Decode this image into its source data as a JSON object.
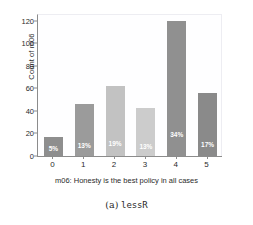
{
  "figure": {
    "caption_tag": "(a)",
    "caption_name": "lessR"
  },
  "chart_data": {
    "type": "bar",
    "title": "",
    "categories": [
      "0",
      "1",
      "2",
      "3",
      "4",
      "5"
    ],
    "values": [
      17,
      46,
      62,
      43,
      120,
      56
    ],
    "data_labels": [
      "5%",
      "13%",
      "19%",
      "13%",
      "34%",
      "17%"
    ],
    "bar_colors": [
      "#8e8e8e",
      "#9b9b9b",
      "#c2c2c2",
      "#cccccc",
      "#909090",
      "#8a8a8a"
    ],
    "xlabel": "m06: Honesty is the best policy in all cases",
    "ylabel": "Count of m06",
    "xlim": [
      -0.5,
      5.5
    ],
    "ylim": [
      0,
      126
    ],
    "yticks": [
      0,
      20,
      40,
      60,
      80,
      100,
      120
    ],
    "ytick_labels": [
      "0",
      "20",
      "40",
      "60",
      "80",
      "100",
      "120"
    ],
    "grid": false,
    "legend": "none",
    "plot_background": "#fefeff",
    "axis_color": "#8c8c8c",
    "label_color": "#2b2b2b"
  }
}
